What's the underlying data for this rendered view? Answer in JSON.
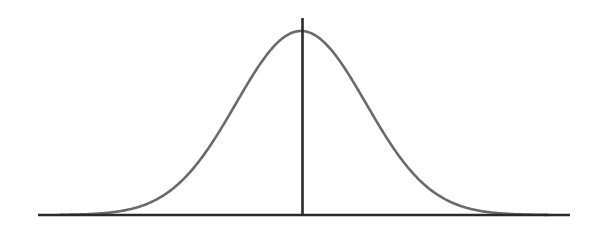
{
  "figure": {
    "background_color": "#ffffff",
    "width": 599,
    "height": 245
  },
  "colors": {
    "curve": "#6a6a6a",
    "axis": "#2a2a2a",
    "background": "#ffffff"
  },
  "geometry": {
    "baseline": {
      "x_start": 38,
      "x_end": 570,
      "y": 215,
      "stroke_width": 2.6
    },
    "mean_line": {
      "x": 302.5,
      "y_top": 18,
      "y_bottom": 216,
      "stroke_width": 2.6
    },
    "curve": {
      "stroke_width": 2.6,
      "peak_x": 301,
      "peak_y": 31,
      "sigma_px": 65,
      "x_start": 60,
      "x_end": 556
    }
  },
  "chart_data": {
    "type": "line",
    "title": "",
    "subtitle": "",
    "xlabel": "",
    "ylabel": "",
    "grid": false,
    "legend_position": "none",
    "annotations": [
      {
        "name": "mean-vertical-line",
        "kind": "vline",
        "x": 0,
        "label": ""
      }
    ],
    "axis_visible": {
      "x": true,
      "y": false
    },
    "xlim": [
      -4.04,
      3.92
    ],
    "ylim": [
      0,
      1.07
    ],
    "xticks": [],
    "yticks": [],
    "series": [
      {
        "name": "Normal density",
        "distribution": "gaussian",
        "mean": 0,
        "sigma": 1,
        "peak_value": 1.0,
        "x": [
          -4.0,
          -3.8,
          -3.6,
          -3.4,
          -3.2,
          -3.0,
          -2.8,
          -2.6,
          -2.4,
          -2.2,
          -2.0,
          -1.8,
          -1.6,
          -1.4,
          -1.2,
          -1.0,
          -0.8,
          -0.6,
          -0.4,
          -0.2,
          0.0,
          0.2,
          0.4,
          0.6,
          0.8,
          1.0,
          1.2,
          1.4,
          1.6,
          1.8,
          2.0,
          2.2,
          2.4,
          2.6,
          2.8,
          3.0,
          3.2,
          3.4,
          3.6,
          3.8
        ],
        "values": [
          0.0003,
          0.0007,
          0.0016,
          0.0032,
          0.0063,
          0.0111,
          0.0198,
          0.034,
          0.0561,
          0.0889,
          0.1353,
          0.1979,
          0.278,
          0.3753,
          0.4868,
          0.6065,
          0.7261,
          0.8353,
          0.9231,
          0.9802,
          1.0,
          0.9802,
          0.9231,
          0.8353,
          0.7261,
          0.6065,
          0.4868,
          0.3753,
          0.278,
          0.1979,
          0.1353,
          0.0889,
          0.0561,
          0.034,
          0.0198,
          0.0111,
          0.0063,
          0.0032,
          0.0016,
          0.0007
        ]
      }
    ]
  },
  "elements": {
    "baseline_name": "x-axis-baseline",
    "mean_line_name": "mean-vertical-line",
    "curve_name": "bell-curve-path"
  }
}
